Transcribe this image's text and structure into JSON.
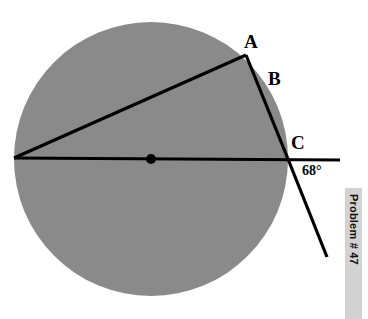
{
  "figure": {
    "width": 368,
    "height": 319,
    "background_color": "#ffffff"
  },
  "labels": {
    "point_a": "A",
    "point_b": "B",
    "point_c": "C",
    "angle": "68°"
  },
  "sidebar_strip": {
    "text": "Problem # 47",
    "background_color": "#d2d2d2",
    "text_color": "#111111"
  },
  "chart_data": {
    "type": "diagram",
    "title": "",
    "colors": {
      "circle_fill": "#8a8a8a",
      "stroke": "#000000",
      "background": "#ffffff",
      "strip": "#d2d2d2"
    },
    "circle": {
      "center_x": 151,
      "center_y": 159,
      "radius": 137,
      "fill": "#8a8a8a"
    },
    "center_dot": {
      "x": 151,
      "y": 159,
      "radius": 5,
      "fill": "#000000"
    },
    "points": {
      "left_vertex": {
        "x": 14,
        "y": 158
      },
      "A": {
        "x": 246,
        "y": 55
      },
      "C": {
        "x": 288,
        "y": 159
      },
      "diameter_right_end": {
        "x": 340,
        "y": 160
      },
      "lower_ray_end": {
        "x": 327,
        "y": 257
      }
    },
    "segments": [
      {
        "name": "diameter-line",
        "x1": 14,
        "y1": 158,
        "x2": 340,
        "y2": 160,
        "width": 3
      },
      {
        "name": "secant-line",
        "x1": 14,
        "y1": 158,
        "x2": 246,
        "y2": 55,
        "width": 3
      },
      {
        "name": "chord-a-to-c",
        "x1": 246,
        "y1": 55,
        "x2": 288,
        "y2": 159,
        "width": 3
      },
      {
        "name": "exterior-ray",
        "x1": 288,
        "y1": 159,
        "x2": 327,
        "y2": 257,
        "width": 3
      }
    ],
    "label_positions": {
      "A": {
        "x": 244,
        "y": 32
      },
      "B": {
        "x": 268,
        "y": 69
      },
      "C": {
        "x": 291,
        "y": 133
      },
      "angle": {
        "x": 302,
        "y": 164
      }
    },
    "angle_value": 68,
    "angle_unit": "degrees"
  }
}
